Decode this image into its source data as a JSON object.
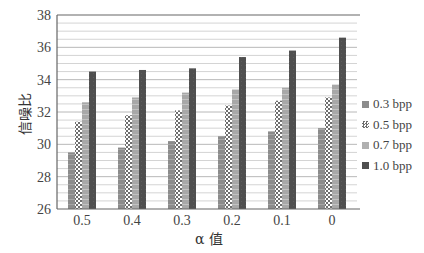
{
  "chart_data": {
    "type": "bar",
    "title": "",
    "xlabel": "α 值",
    "ylabel": "信噪比",
    "ylim": [
      26,
      38
    ],
    "yticks": [
      26,
      28,
      30,
      32,
      34,
      36,
      38
    ],
    "grid": true,
    "legend_position": "right",
    "categories": [
      "0.5",
      "0.4",
      "0.3",
      "0.2",
      "0.1",
      "0"
    ],
    "series": [
      {
        "name": "0.3 bpp",
        "values": [
          29.5,
          29.8,
          30.2,
          30.5,
          30.8,
          31.0
        ],
        "color": "#8c8c8c",
        "pattern": "horizontal-lines"
      },
      {
        "name": "0.5 bpp",
        "values": [
          31.4,
          31.8,
          32.1,
          32.4,
          32.7,
          32.9
        ],
        "color": "#9a9a9a",
        "pattern": "checker"
      },
      {
        "name": "0.7 bpp",
        "values": [
          32.6,
          32.9,
          33.2,
          33.4,
          33.5,
          33.7
        ],
        "color": "#a8a8a8",
        "pattern": "horizontal-lines"
      },
      {
        "name": "1.0 bpp",
        "values": [
          34.5,
          34.6,
          34.7,
          35.4,
          35.8,
          36.6
        ],
        "color": "#4f4f4f",
        "pattern": "solid"
      }
    ]
  },
  "legend": {
    "items": [
      {
        "label": "0.3 bpp",
        "color": "#8c8c8c"
      },
      {
        "label": "0.5 bpp",
        "color": "#9a9a9a"
      },
      {
        "label": "0.7 bpp",
        "color": "#b0b0b0"
      },
      {
        "label": "1.0 bpp",
        "color": "#4f4f4f"
      }
    ]
  }
}
